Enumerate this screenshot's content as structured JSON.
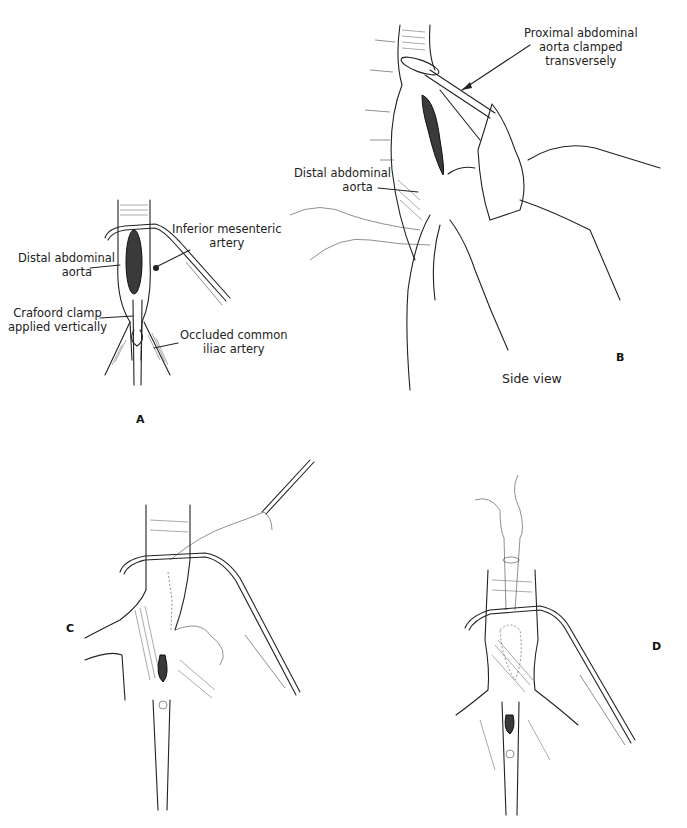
{
  "figure": {
    "panels": [
      {
        "id": "A",
        "letter": "A",
        "labels": {
          "distal_aorta": [
            "Distal abdominal",
            "aorta"
          ],
          "inferior_mesenteric": [
            "Inferior mesenteric",
            "artery"
          ],
          "crafoord_clamp": [
            "Crafoord clamp",
            "applied vertically"
          ],
          "occluded_iliac": [
            "Occluded common",
            "iliac artery"
          ]
        },
        "instrument_mark": "②"
      },
      {
        "id": "B",
        "letter": "B",
        "caption": "Side view",
        "labels": {
          "proximal_aorta": [
            "Proximal abdominal",
            "aorta clamped",
            "transversely"
          ],
          "distal_aorta": [
            "Distal abdominal",
            "aorta"
          ]
        }
      },
      {
        "id": "C",
        "letter": "C",
        "instrument_mark": "①"
      },
      {
        "id": "D",
        "letter": "D",
        "instrument_mark": "②"
      }
    ]
  }
}
